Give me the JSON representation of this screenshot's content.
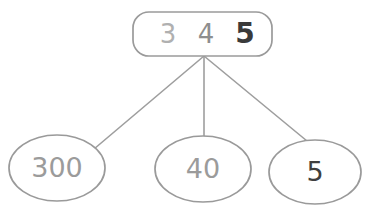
{
  "diagram": {
    "type": "place-value-decomposition-tree",
    "background_color": "#ffffff",
    "stroke_color": "#9a9a9a",
    "line_color": "#9e9e9e",
    "parent": {
      "name": "number-345",
      "shape": "rounded-rectangle",
      "digits": [
        {
          "label": "3",
          "color": "#b0b0b0",
          "weight": "400"
        },
        {
          "label": "4",
          "color": "#8e8e8e",
          "weight": "400"
        },
        {
          "label": "5",
          "color": "#3a3a3a",
          "weight": "700"
        }
      ]
    },
    "children": [
      {
        "name": "place-value-hundreds",
        "label": "300",
        "shape": "ellipse",
        "color": "#9b9b9b",
        "weight": "400"
      },
      {
        "name": "place-value-tens",
        "label": "40",
        "shape": "ellipse",
        "color": "#9b9b9b",
        "weight": "400"
      },
      {
        "name": "place-value-ones",
        "label": "5",
        "shape": "ellipse",
        "color": "#3f3f3f",
        "weight": "400"
      }
    ]
  }
}
